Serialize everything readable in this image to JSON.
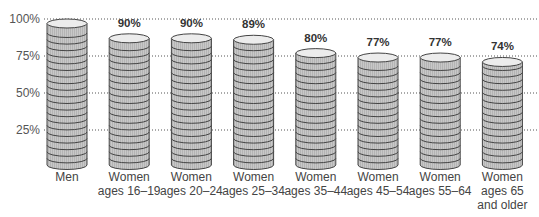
{
  "chart_data": {
    "type": "bar",
    "style": "stacked-coin cylinders",
    "title": "",
    "xlabel": "",
    "ylabel": "",
    "ylim": [
      0,
      100
    ],
    "yticks": [
      "25%",
      "50%",
      "75%",
      "100%"
    ],
    "ytick_values": [
      25,
      50,
      75,
      100
    ],
    "grid": "dotted horizontal",
    "categories": [
      "Men",
      "Women ages 16–19",
      "Women ages 20–24",
      "Women ages 25–34",
      "Women ages 35–44",
      "Women ages 45–54",
      "Women ages 55–64",
      "Women ages 65 and older"
    ],
    "category_lines": [
      [
        "Men"
      ],
      [
        "Women",
        "ages 16–19"
      ],
      [
        "Women",
        "ages 20–24"
      ],
      [
        "Women",
        "ages 25–34"
      ],
      [
        "Women",
        "ages 35–44"
      ],
      [
        "Women",
        "ages 45–54"
      ],
      [
        "Women",
        "ages 55–64"
      ],
      [
        "Women",
        "ages 65",
        "and older"
      ]
    ],
    "values": [
      100,
      90,
      90,
      89,
      80,
      77,
      77,
      74
    ],
    "data_labels": [
      "",
      "90%",
      "90%",
      "89%",
      "80%",
      "77%",
      "77%",
      "74%"
    ],
    "colors": {
      "fill": "#c8c8c8",
      "top": "#ececec",
      "stroke": "#444444",
      "grid": "#555555"
    }
  }
}
